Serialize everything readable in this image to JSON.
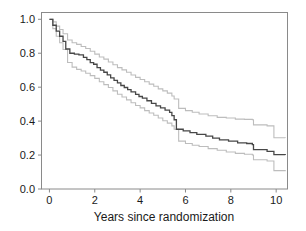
{
  "chart_data": {
    "type": "line",
    "title": "",
    "subtitle": "",
    "xlabel": "Years since randomization",
    "ylabel": "",
    "xlim": [
      -0.35,
      10.5
    ],
    "ylim": [
      0.0,
      1.04
    ],
    "xticks": [
      0,
      2,
      4,
      6,
      8,
      10
    ],
    "xticklabels": [
      "0",
      "2",
      "4",
      "6",
      "8",
      "10"
    ],
    "yticks": [
      0.0,
      0.2,
      0.4,
      0.6,
      0.8,
      1.0
    ],
    "yticklabels": [
      "0.0",
      "0.2",
      "0.4",
      "0.6",
      "0.8",
      "1.0"
    ],
    "grid": false,
    "legend": "none",
    "step_style": "post",
    "colors": {
      "estimate": "#474747",
      "confidence_interval": "#bdbdbd",
      "frame": "#8a8a8a",
      "text": "#1a1a1a",
      "background": "#ffffff"
    },
    "series": [
      {
        "name": "Kaplan-Meier estimate",
        "role": "estimate",
        "color": "#474747",
        "x": [
          0.0,
          0.15,
          0.3,
          0.45,
          0.6,
          0.72,
          0.9,
          1.1,
          1.3,
          1.5,
          1.65,
          1.8,
          1.95,
          2.1,
          2.25,
          2.4,
          2.55,
          2.7,
          2.85,
          3.0,
          3.15,
          3.3,
          3.45,
          3.6,
          3.8,
          3.95,
          4.1,
          4.3,
          4.5,
          4.7,
          4.9,
          5.1,
          5.3,
          5.4,
          5.5,
          5.6,
          5.9,
          6.2,
          6.5,
          6.9,
          7.2,
          7.5,
          7.9,
          8.3,
          8.7,
          8.95,
          9.0,
          9.6,
          9.9,
          10.4
        ],
        "y": [
          1.0,
          0.965,
          0.93,
          0.9,
          0.87,
          0.825,
          0.8,
          0.795,
          0.79,
          0.775,
          0.762,
          0.745,
          0.735,
          0.715,
          0.7,
          0.688,
          0.672,
          0.655,
          0.64,
          0.625,
          0.61,
          0.598,
          0.585,
          0.572,
          0.558,
          0.545,
          0.535,
          0.52,
          0.505,
          0.49,
          0.478,
          0.465,
          0.452,
          0.432,
          0.408,
          0.352,
          0.342,
          0.332,
          0.322,
          0.312,
          0.3,
          0.29,
          0.282,
          0.272,
          0.268,
          0.262,
          0.232,
          0.222,
          0.202,
          0.2
        ]
      },
      {
        "name": "Upper 95% confidence limit",
        "role": "ci_upper",
        "color": "#bdbdbd",
        "x": [
          0.0,
          0.15,
          0.3,
          0.45,
          0.6,
          0.8,
          1.0,
          1.2,
          1.4,
          1.6,
          1.8,
          2.0,
          2.2,
          2.4,
          2.6,
          2.8,
          3.0,
          3.2,
          3.4,
          3.6,
          3.8,
          4.0,
          4.2,
          4.4,
          4.6,
          4.8,
          5.0,
          5.2,
          5.4,
          5.5,
          5.7,
          6.0,
          6.3,
          6.6,
          7.0,
          7.4,
          7.8,
          8.2,
          8.6,
          8.95,
          9.0,
          9.6,
          9.9,
          10.4
        ],
        "y": [
          1.0,
          0.985,
          0.96,
          0.94,
          0.915,
          0.878,
          0.862,
          0.852,
          0.84,
          0.828,
          0.812,
          0.795,
          0.778,
          0.765,
          0.748,
          0.732,
          0.715,
          0.702,
          0.688,
          0.672,
          0.658,
          0.645,
          0.632,
          0.618,
          0.605,
          0.59,
          0.578,
          0.565,
          0.548,
          0.53,
          0.475,
          0.462,
          0.452,
          0.442,
          0.432,
          0.422,
          0.418,
          0.412,
          0.41,
          0.408,
          0.378,
          0.372,
          0.302,
          0.3
        ]
      },
      {
        "name": "Lower 95% confidence limit",
        "role": "ci_lower",
        "color": "#bdbdbd",
        "x": [
          0.0,
          0.15,
          0.3,
          0.45,
          0.6,
          0.8,
          1.0,
          1.2,
          1.4,
          1.6,
          1.8,
          2.0,
          2.2,
          2.4,
          2.6,
          2.8,
          3.0,
          3.2,
          3.4,
          3.6,
          3.8,
          4.0,
          4.2,
          4.4,
          4.6,
          4.8,
          5.0,
          5.2,
          5.4,
          5.5,
          5.7,
          6.0,
          6.3,
          6.6,
          7.0,
          7.4,
          7.8,
          8.2,
          8.6,
          8.95,
          9.0,
          9.6,
          9.9,
          10.4
        ],
        "y": [
          1.0,
          0.945,
          0.9,
          0.862,
          0.822,
          0.745,
          0.718,
          0.705,
          0.695,
          0.682,
          0.668,
          0.652,
          0.632,
          0.615,
          0.598,
          0.578,
          0.558,
          0.542,
          0.525,
          0.508,
          0.492,
          0.478,
          0.462,
          0.448,
          0.435,
          0.418,
          0.402,
          0.388,
          0.372,
          0.352,
          0.282,
          0.268,
          0.258,
          0.25,
          0.238,
          0.228,
          0.218,
          0.21,
          0.205,
          0.2,
          0.172,
          0.165,
          0.108,
          0.105
        ]
      }
    ],
    "annotations": []
  },
  "axis": {
    "x_title": "Years since randomization"
  }
}
